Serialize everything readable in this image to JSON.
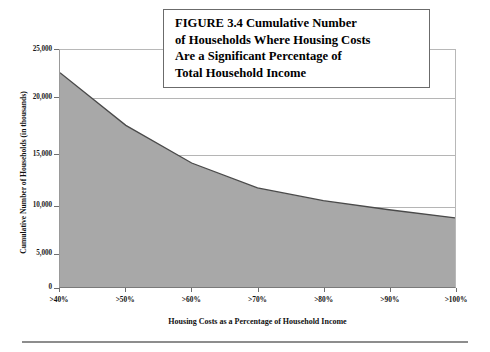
{
  "figure": {
    "title_lines": [
      "FIGURE 3.4  Cumulative Number",
      "of Households Where Housing Costs",
      "Are a Significant Percentage of",
      "Total Household Income"
    ],
    "area_fill_color": "#a8a8a8",
    "area_line_color": "#4a4a4a",
    "grid_color": "#b5b5b5"
  },
  "chart_data": {
    "type": "area",
    "title": "FIGURE 3.4  Cumulative Number of Households Where Housing Costs Are a Significant Percentage of Total Household Income",
    "xlabel": "Housing Costs as a Percentage of Household Income",
    "ylabel": "Cumulative Number of Households (in thousands)",
    "categories": [
      ">40%",
      ">50%",
      ">60%",
      ">70%",
      ">80%",
      ">90%",
      ">100%"
    ],
    "values": [
      22600,
      17050,
      13080,
      10450,
      9100,
      8150,
      7300
    ],
    "ylim": [
      0,
      25000
    ],
    "ytick_labels": [
      "25,000",
      "20,000",
      "15,000",
      "10,000",
      "5,000",
      "0"
    ],
    "ytick_values": [
      25000,
      20000,
      15000,
      10000,
      5000,
      0
    ],
    "grid": true,
    "legend": "none"
  }
}
